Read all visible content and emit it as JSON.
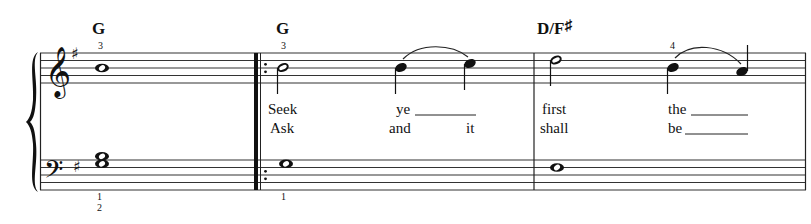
{
  "score": {
    "key_signature": "G major (1 sharp)",
    "clefs": [
      "treble",
      "bass"
    ],
    "measures": [
      {
        "chord": "G",
        "treble_fingering": "3",
        "bass_fingering": [
          "1",
          "2"
        ],
        "treble_notes": [
          "B4 whole"
        ],
        "bass_notes": [
          "G3+B3 whole"
        ],
        "lyrics_verse1": [],
        "lyrics_verse2": []
      },
      {
        "chord": "G",
        "repeat_start": true,
        "treble_fingering": "3",
        "bass_fingering": [
          "1"
        ],
        "treble_notes": [
          "B4 half",
          "B4 quarter",
          "C5 quarter"
        ],
        "bass_notes": [
          "G3 whole"
        ],
        "lyrics_verse1": [
          "Seek",
          "ye"
        ],
        "lyrics_verse2": [
          "Ask",
          "and",
          "it"
        ]
      },
      {
        "chord": "D/F♯",
        "treble_fingering": "4",
        "treble_notes": [
          "D5 half",
          "B4 quarter",
          "A4 quarter"
        ],
        "bass_notes": [
          "F#3 whole"
        ],
        "lyrics_verse1": [
          "first",
          "the"
        ],
        "lyrics_verse2": [
          "shall",
          "be"
        ]
      }
    ]
  },
  "labels": {
    "chord1": "G",
    "chord2": "G",
    "chord3_main": "D/F",
    "chord3_sharp": "♯",
    "fing_m1_treble": "3",
    "fing_m1_bass_top": "1",
    "fing_m1_bass_bottom": "2",
    "fing_m2_treble": "3",
    "fing_m2_bass": "1",
    "fing_m3_treble": "4",
    "lyric_seek": "Seek",
    "lyric_ye": "ye",
    "lyric_ask": "Ask",
    "lyric_and": "and",
    "lyric_it": "it",
    "lyric_first": "first",
    "lyric_the": "the",
    "lyric_shall": "shall",
    "lyric_be": "be"
  }
}
